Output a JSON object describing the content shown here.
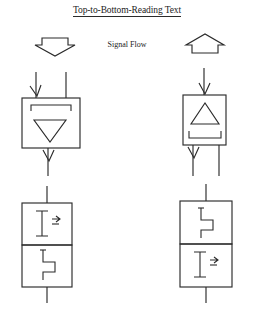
{
  "page": {
    "width": 254,
    "height": 315,
    "background": "#ffffff",
    "ink": "#2b2b2b"
  },
  "title": {
    "text": "Top-to-Bottom-Reading Text",
    "underlined": true
  },
  "legend": {
    "label": "Signal Flow",
    "left_arrow": {
      "icon": "arrow-down-outline",
      "direction": "down"
    },
    "right_arrow": {
      "icon": "arrow-up-outline",
      "direction": "up"
    }
  },
  "diagrams": [
    {
      "id": "upper-left",
      "name": "down-reading-amplifier",
      "box": {
        "x": 22,
        "y": 98,
        "w": 58,
        "h": 50
      },
      "inner_symbol": {
        "icon": "triangle-down-icon",
        "direction": "down"
      },
      "inner_bar": {
        "icon": "bracket-bar-icon",
        "position": "top"
      },
      "inputs": [
        {
          "side": "top",
          "x": 36,
          "from_y": 72,
          "arrowhead": true
        },
        {
          "side": "top",
          "x": 66,
          "from_y": 72,
          "arrowhead": false
        }
      ],
      "outputs": [
        {
          "side": "bottom",
          "x": 48,
          "to_y": 176,
          "arrowhead": true
        }
      ]
    },
    {
      "id": "upper-right",
      "name": "up-reading-amplifier",
      "box": {
        "x": 183,
        "y": 95,
        "w": 43,
        "h": 50
      },
      "inner_symbol": {
        "icon": "triangle-up-icon",
        "direction": "up"
      },
      "inner_bar": {
        "icon": "bracket-bar-icon",
        "position": "bottom"
      },
      "inputs": [
        {
          "side": "top",
          "x": 204,
          "from_y": 70,
          "arrowhead": true
        }
      ],
      "outputs": [
        {
          "side": "bottom",
          "x": 193,
          "to_y": 176,
          "arrowhead": true
        },
        {
          "side": "bottom",
          "x": 219,
          "to_y": 176,
          "arrowhead": false
        }
      ]
    },
    {
      "id": "lower-left",
      "name": "stacked-pair-left",
      "box": {
        "x": 22,
        "y": 203,
        "w": 50,
        "h": 84
      },
      "divider_y": 245,
      "cells": [
        {
          "position": "top",
          "icon": "i-beam-with-arrow-icon"
        },
        {
          "position": "bottom",
          "icon": "zigzag-step-icon"
        }
      ],
      "lead_top": {
        "x": 47,
        "from_y": 186
      },
      "lead_bottom": {
        "x": 47,
        "to_y": 303
      }
    },
    {
      "id": "lower-right",
      "name": "stacked-pair-right",
      "box": {
        "x": 180,
        "y": 201,
        "w": 52,
        "h": 86
      },
      "divider_y": 244,
      "cells": [
        {
          "position": "top",
          "icon": "zigzag-step-icon"
        },
        {
          "position": "bottom",
          "icon": "i-beam-with-arrow-icon"
        }
      ],
      "lead_top": {
        "x": 206,
        "from_y": 184
      },
      "lead_bottom": {
        "x": 206,
        "to_y": 303
      }
    }
  ]
}
